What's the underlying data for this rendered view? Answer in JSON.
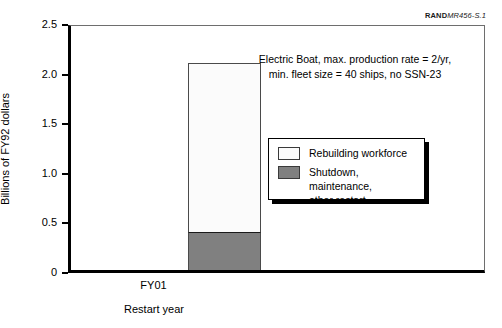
{
  "credit": {
    "mark": "RAND",
    "id": "MR456-S.1"
  },
  "chart_data": {
    "type": "bar",
    "stacked": true,
    "title": "",
    "xlabel": "Restart year",
    "ylabel": "Billions of FY92 dollars",
    "categories": [
      "FY01"
    ],
    "ylim": [
      0,
      2.5
    ],
    "yticks": [
      "0",
      "0.5",
      "1.0",
      "1.5",
      "2.0",
      "2.5"
    ],
    "ytick_values": [
      0,
      0.5,
      1.0,
      1.5,
      2.0,
      2.5
    ],
    "grid": false,
    "legend_position": "center-right",
    "series": [
      {
        "name": "Rebuilding workforce",
        "values": [
          1.71
        ],
        "color": "#fbfbfb"
      },
      {
        "name": "Shutdown, maintenance,\nother restart",
        "values": [
          0.38
        ],
        "color": "#808080"
      }
    ],
    "totals": [
      2.09
    ],
    "annotations": [
      "Electric Boat, max. production rate = 2/yr,",
      "min. fleet size = 40 ships, no SSN-23"
    ]
  },
  "legend": {
    "items": [
      {
        "label": "Rebuilding workforce",
        "color": "#fbfbfb"
      },
      {
        "label": "Shutdown, maintenance,\nother restart",
        "color": "#808080"
      }
    ]
  },
  "colors": {
    "axis": "#000000",
    "frame": "#6e6e6e",
    "white_segment": "#fbfbfb",
    "gray_segment": "#808080",
    "text": "#000000"
  }
}
